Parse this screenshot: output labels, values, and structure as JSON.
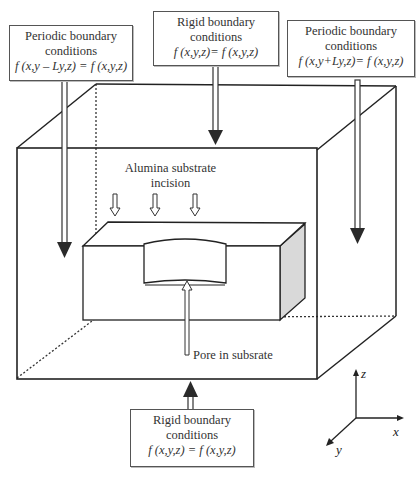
{
  "figure": {
    "type": "3D simulation domain schematic",
    "boxes": {
      "top_left": {
        "title_line1": "Periodic boundary",
        "title_line2": "conditions",
        "equation": "f (x,y – Ly,z) = f (x,y,z)"
      },
      "top_center": {
        "title_line1": "Rigid boundary",
        "title_line2": "conditions",
        "equation": "f (x,y,z)= f (x,y,z)"
      },
      "top_right": {
        "title_line1": "Periodic boundary",
        "title_line2": "conditions",
        "equation": "f (x,y+Ly,z)= f (x,y,z)"
      },
      "bottom_center": {
        "title_line1": "Rigid boundary",
        "title_line2": "conditions",
        "equation": "f (x,y,z) = f (x,y,z)"
      }
    },
    "annotations": {
      "incision_line1": "Alumina substrate",
      "incision_line2": "incision",
      "pore": "Pore in subsrate"
    },
    "axes": {
      "z": "z",
      "x": "x",
      "y": "y"
    },
    "colors": {
      "line": "#222222",
      "arrow_fill": "#2a2a2a",
      "shade_face": "#d9d9d9",
      "box_border": "#555555"
    }
  }
}
